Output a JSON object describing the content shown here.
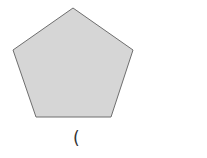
{
  "figure": {
    "shape": "regular-pentagon",
    "fill": "#d6d6d6",
    "stroke": "#6e6e6e",
    "points": "73,8 133,50 111,117 36,117 13,50"
  },
  "caption": {
    "text": "("
  }
}
